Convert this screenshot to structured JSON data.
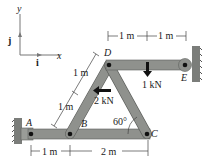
{
  "axes": {
    "y_label": "y",
    "x_label": "x",
    "j_label": "j",
    "i_label": "i"
  },
  "points": {
    "A": "A",
    "B": "B",
    "C": "C",
    "D": "D",
    "E": "E"
  },
  "dimensions": {
    "top_left": "1 m",
    "top_right": "1 m",
    "bd_upper": "1 m",
    "bd_lower": "1 m",
    "bottom_left": "1 m",
    "bottom_right": "2 m"
  },
  "loads": {
    "vertical": "1 kN",
    "horizontal": "2 kN"
  },
  "angle": "60°",
  "colors": {
    "member": "#8f918d",
    "member_edge": "#5d5f5c",
    "wall": "#7b7d7a",
    "dim": "#444444"
  }
}
